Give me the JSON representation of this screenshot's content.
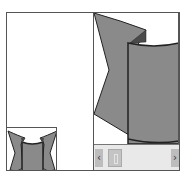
{
  "viewer": {
    "thumbnail": {
      "label": "navigator-thumbnail"
    },
    "main_view": {
      "label": "zoomed-image-view"
    },
    "scrollbar": {
      "left_arrow": "‹",
      "right_arrow": "›"
    },
    "colors": {
      "shape_fill": "#8a8a8a",
      "shape_dark": "#5a5a5a",
      "border": "#555555",
      "scrollbar_bg": "#e9e9e9"
    }
  }
}
